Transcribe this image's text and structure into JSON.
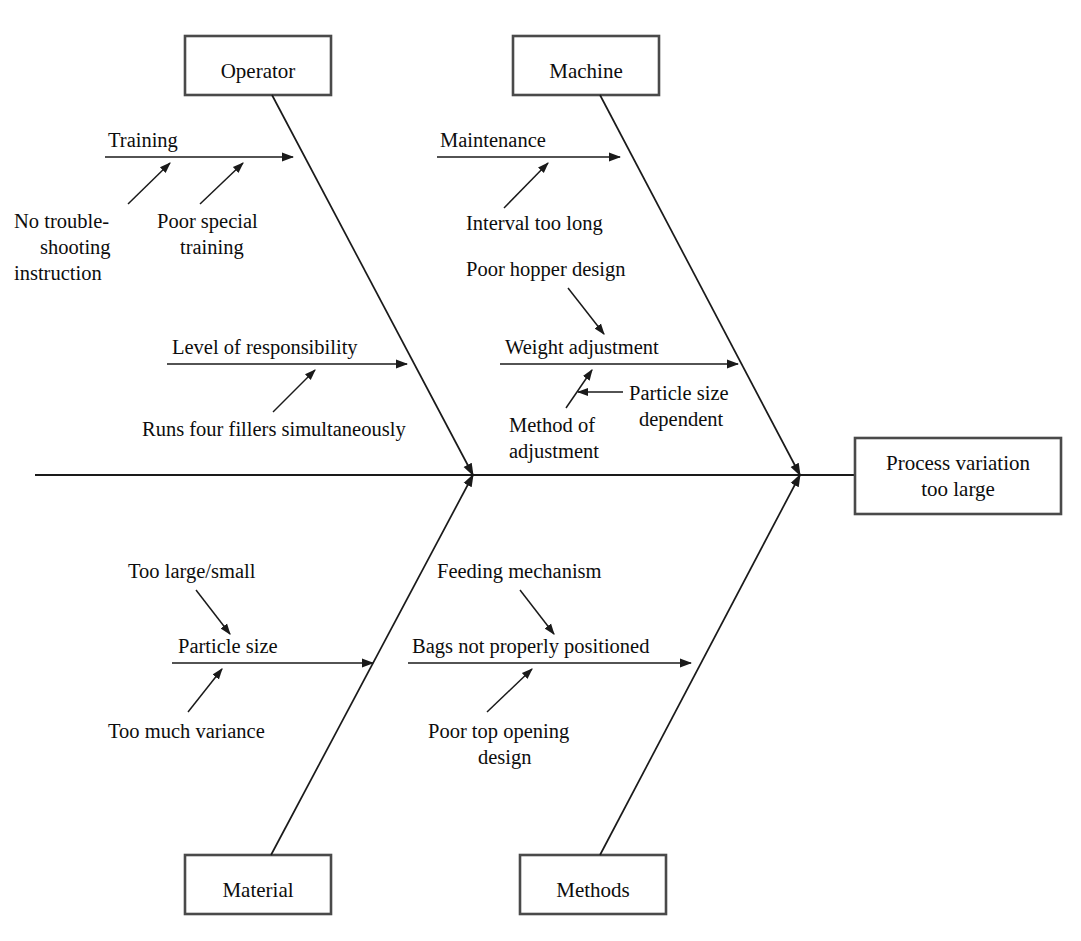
{
  "diagram": {
    "type": "fishbone-ishikawa",
    "effect": {
      "line1": "Process variation",
      "line2": "too large"
    },
    "categories": [
      {
        "id": "operator",
        "label": "Operator",
        "position": "top-left",
        "branches": [
          {
            "label": "Training",
            "causes": [
              {
                "line1": "No trouble-",
                "line2": "shooting",
                "line3": "instruction"
              },
              {
                "line1": "Poor special",
                "line2": "training"
              }
            ]
          },
          {
            "label": "Level of responsibility",
            "causes": [
              {
                "line1": "Runs four fillers simultaneously"
              }
            ]
          }
        ]
      },
      {
        "id": "machine",
        "label": "Machine",
        "position": "top-right",
        "branches": [
          {
            "label": "Maintenance",
            "causes": [
              {
                "line1": "Interval too long"
              }
            ]
          },
          {
            "label": "Weight adjustment",
            "causes": [
              {
                "line1": "Poor hopper design"
              },
              {
                "line1": "Method of",
                "line2": "adjustment"
              },
              {
                "line1": "Particle size",
                "line2": "dependent"
              }
            ]
          }
        ]
      },
      {
        "id": "material",
        "label": "Material",
        "position": "bottom-left",
        "branches": [
          {
            "label": "Particle size",
            "causes": [
              {
                "line1": "Too large/small"
              },
              {
                "line1": "Too much variance"
              }
            ]
          }
        ]
      },
      {
        "id": "methods",
        "label": "Methods",
        "position": "bottom-right",
        "branches": [
          {
            "label": "Bags not properly positioned",
            "causes": [
              {
                "line1": "Feeding mechanism"
              },
              {
                "line1": "Poor top opening",
                "line2": "design"
              }
            ]
          }
        ]
      }
    ]
  },
  "labels": {
    "operator_box": "Operator",
    "machine_box": "Machine",
    "material_box": "Material",
    "methods_box": "Methods",
    "effect_line1": "Process variation",
    "effect_line2": "too large",
    "training": "Training",
    "no_troubleshooting_1": "No trouble-",
    "no_troubleshooting_2": "shooting",
    "no_troubleshooting_3": "instruction",
    "poor_special_1": "Poor special",
    "poor_special_2": "training",
    "level_of_responsibility": "Level of responsibility",
    "runs_four_fillers": "Runs four fillers simultaneously",
    "maintenance": "Maintenance",
    "interval_too_long": "Interval too long",
    "poor_hopper_design": "Poor hopper design",
    "weight_adjustment": "Weight adjustment",
    "particle_size_dep_1": "Particle size",
    "particle_size_dep_2": "dependent",
    "method_of_adjustment_1": "Method of",
    "method_of_adjustment_2": "adjustment",
    "too_large_small": "Too large/small",
    "particle_size": "Particle size",
    "too_much_variance": "Too much variance",
    "feeding_mechanism": "Feeding mechanism",
    "bags_not_positioned": "Bags not properly positioned",
    "poor_top_opening_1": "Poor top opening",
    "poor_top_opening_2": "design"
  },
  "colors": {
    "line": "#1a1a1a",
    "box_border": "#4a4a4a",
    "background": "#ffffff",
    "text": "#0d0d0d"
  }
}
